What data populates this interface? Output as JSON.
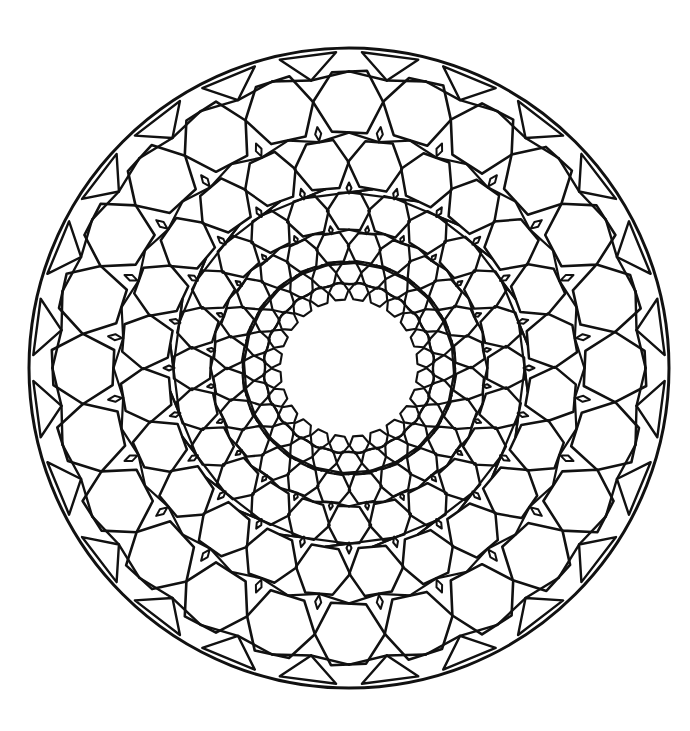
{
  "image": {
    "subject": "mandala-coloring-page",
    "background_color": "#ffffff",
    "line_color": "#111111"
  },
  "mandala": {
    "center": [
      349,
      368
    ],
    "outer_radius": 320,
    "inner_void_radius": 62,
    "units_per_ring": 24,
    "rings": [
      {
        "radius": 266,
        "hex_size": 36,
        "offset": 0.0,
        "stroke": 2.6
      },
      {
        "radius": 204,
        "hex_size": 28,
        "offset": 0.5,
        "stroke": 2.5
      },
      {
        "radius": 157,
        "hex_size": 22,
        "offset": 0.0,
        "stroke": 2.4
      },
      {
        "radius": 121,
        "hex_size": 17,
        "offset": 0.5,
        "stroke": 2.3
      },
      {
        "radius": 95,
        "hex_size": 13,
        "offset": 0.0,
        "stroke": 2.2
      },
      {
        "radius": 77,
        "hex_size": 10,
        "offset": 0.5,
        "stroke": 2.1
      }
    ],
    "diamonds": [
      {
        "radius": 236,
        "length": 14,
        "width": 6,
        "offset": 0.5
      },
      {
        "radius": 180,
        "length": 11,
        "width": 5,
        "offset": 0.0
      },
      {
        "radius": 139,
        "length": 8,
        "width": 4,
        "offset": 0.5
      }
    ],
    "rim_notches": {
      "count": 24,
      "offset": 0.5,
      "depth": 26,
      "half_width": 0.09
    },
    "rim_stroke": 3
  }
}
